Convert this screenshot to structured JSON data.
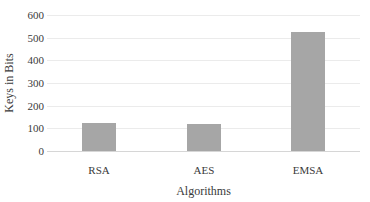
{
  "chart_data": {
    "type": "bar",
    "title": "",
    "categories": [
      "RSA",
      "AES",
      "EMSA"
    ],
    "values": [
      125,
      120,
      525
    ],
    "xlabel": "Algorithms",
    "ylabel": "Keys in Bits",
    "ylim": [
      0,
      600
    ],
    "yticks": [
      0,
      100,
      200,
      300,
      400,
      500,
      600
    ],
    "grid": true,
    "legend": false,
    "bar_color": "#a6a6a6",
    "gridline_color": "#ebebeb",
    "axis_line_color": "#d6d6d6",
    "text_color": "#3a3a3a",
    "background": "#ffffff"
  }
}
